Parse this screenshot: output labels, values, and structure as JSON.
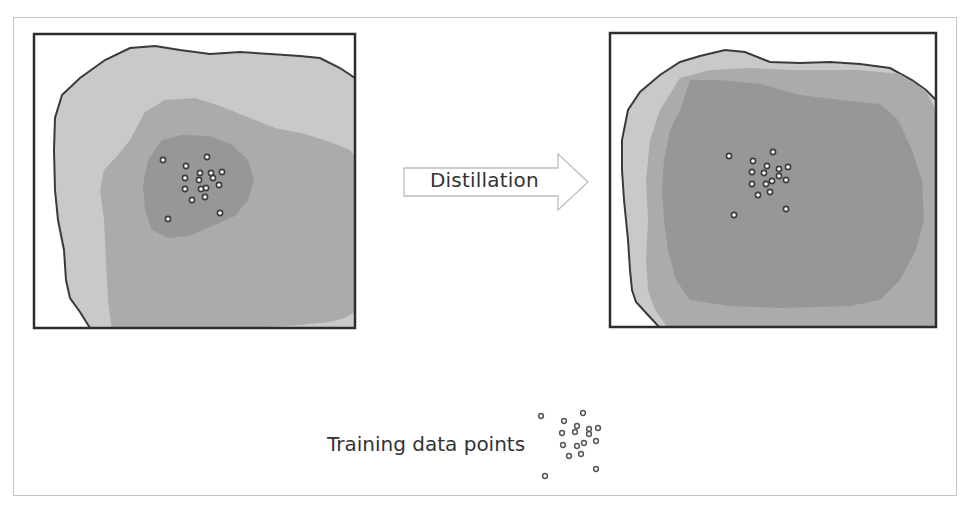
{
  "diagram": {
    "arrow": {
      "label": "Distillation",
      "direction": "right"
    },
    "legend": {
      "label": "Training data points",
      "marker": "hollow-circle"
    },
    "panels": [
      {
        "id": "teacher",
        "description": "Decision regions before distillation: concentrated around training points",
        "regions": [
          "outer-light",
          "middle",
          "inner-dark"
        ]
      },
      {
        "id": "student",
        "description": "Decision regions after distillation: broadened, more uniform",
        "regions": [
          "outer-light",
          "middle",
          "inner-dark"
        ]
      }
    ],
    "colors": {
      "outer": "#c9c9c9",
      "middle": "#ababab",
      "inner": "#979797",
      "border": "#333333",
      "point_fill": "#ffffff",
      "point_stroke": "#3c3c3c"
    },
    "points_left": [
      [
        163,
        160
      ],
      [
        207,
        157
      ],
      [
        186,
        166
      ],
      [
        200,
        173
      ],
      [
        211,
        173
      ],
      [
        222,
        172
      ],
      [
        185,
        178
      ],
      [
        199,
        180
      ],
      [
        213,
        178
      ],
      [
        219,
        185
      ],
      [
        185,
        189
      ],
      [
        201,
        189
      ],
      [
        206,
        188
      ],
      [
        192,
        200
      ],
      [
        205,
        197
      ],
      [
        220,
        213
      ],
      [
        168,
        219
      ]
    ],
    "points_right": [
      [
        729,
        156
      ],
      [
        773,
        152
      ],
      [
        753,
        161
      ],
      [
        767,
        166
      ],
      [
        779,
        169
      ],
      [
        788,
        167
      ],
      [
        752,
        172
      ],
      [
        764,
        173
      ],
      [
        779,
        176
      ],
      [
        786,
        180
      ],
      [
        752,
        184
      ],
      [
        766,
        184
      ],
      [
        772,
        181
      ],
      [
        758,
        195
      ],
      [
        770,
        192
      ],
      [
        786,
        209
      ],
      [
        734,
        215
      ]
    ],
    "points_legend": [
      [
        541,
        416
      ],
      [
        583,
        413
      ],
      [
        564,
        421
      ],
      [
        577,
        426
      ],
      [
        589,
        429
      ],
      [
        598,
        428
      ],
      [
        562,
        433
      ],
      [
        575,
        432
      ],
      [
        589,
        434
      ],
      [
        596,
        441
      ],
      [
        563,
        445
      ],
      [
        577,
        446
      ],
      [
        584,
        443
      ],
      [
        569,
        456
      ],
      [
        581,
        454
      ],
      [
        596,
        469
      ],
      [
        545,
        476
      ]
    ]
  }
}
